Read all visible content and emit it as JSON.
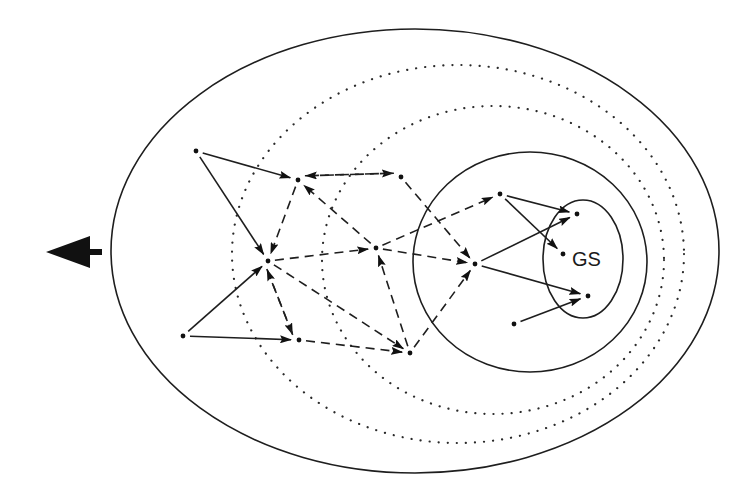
{
  "diagram": {
    "label_gs": "GS",
    "big_arrow": {
      "tip": [
        46,
        252
      ],
      "head_base_x": 90,
      "head_half_height": 16,
      "stem_end_x": 102,
      "stem_half_height": 3
    },
    "regions": [
      {
        "id": "outer",
        "style": "solid",
        "cx": 415,
        "cy": 251,
        "rx": 304,
        "ry": 222
      },
      {
        "id": "dotted-outer",
        "style": "dotted",
        "cx": 458,
        "cy": 254,
        "rx": 226,
        "ry": 189
      },
      {
        "id": "dotted-inner",
        "style": "dotted",
        "cx": 493,
        "cy": 260,
        "rx": 171,
        "ry": 154
      },
      {
        "id": "middle",
        "style": "solid",
        "cx": 530,
        "cy": 262,
        "rx": 117,
        "ry": 110
      },
      {
        "id": "goal-set",
        "style": "solid",
        "cx": 583,
        "cy": 259,
        "rx": 40,
        "ry": 59
      }
    ],
    "nodes": [
      {
        "id": "A",
        "x": 196,
        "y": 151
      },
      {
        "id": "B",
        "x": 298,
        "y": 180
      },
      {
        "id": "C",
        "x": 268,
        "y": 261
      },
      {
        "id": "D",
        "x": 401,
        "y": 177
      },
      {
        "id": "E",
        "x": 376,
        "y": 248
      },
      {
        "id": "F",
        "x": 183,
        "y": 336
      },
      {
        "id": "G",
        "x": 299,
        "y": 340
      },
      {
        "id": "H",
        "x": 410,
        "y": 353
      },
      {
        "id": "I",
        "x": 500,
        "y": 194
      },
      {
        "id": "J",
        "x": 475,
        "y": 264
      },
      {
        "id": "K",
        "x": 577,
        "y": 214
      },
      {
        "id": "L",
        "x": 563,
        "y": 254
      },
      {
        "id": "M",
        "x": 588,
        "y": 296
      },
      {
        "id": "N",
        "x": 514,
        "y": 324
      }
    ],
    "edges": [
      {
        "from": "A",
        "to": "B",
        "style": "solid"
      },
      {
        "from": "A",
        "to": "C",
        "style": "solid"
      },
      {
        "from": "F",
        "to": "C",
        "style": "solid"
      },
      {
        "from": "F",
        "to": "G",
        "style": "solid"
      },
      {
        "from": "B",
        "to": "D",
        "style": "dashed",
        "offset": -4
      },
      {
        "from": "D",
        "to": "B",
        "style": "dashed",
        "offset": -4
      },
      {
        "from": "B",
        "to": "C",
        "style": "dashed"
      },
      {
        "from": "E",
        "to": "B",
        "style": "dashed"
      },
      {
        "from": "C",
        "to": "E",
        "style": "dashed"
      },
      {
        "from": "C",
        "to": "G",
        "style": "dashed",
        "offset": 4
      },
      {
        "from": "G",
        "to": "C",
        "style": "dashed",
        "offset": 4
      },
      {
        "from": "C",
        "to": "H",
        "style": "dashed"
      },
      {
        "from": "G",
        "to": "H",
        "style": "dashed"
      },
      {
        "from": "H",
        "to": "E",
        "style": "dashed"
      },
      {
        "from": "D",
        "to": "J",
        "style": "dashed"
      },
      {
        "from": "E",
        "to": "J",
        "style": "dashed"
      },
      {
        "from": "E",
        "to": "I",
        "style": "dashed"
      },
      {
        "from": "H",
        "to": "J",
        "style": "dashed"
      },
      {
        "from": "I",
        "to": "K",
        "style": "solid"
      },
      {
        "from": "I",
        "to": "L",
        "style": "solid"
      },
      {
        "from": "J",
        "to": "K",
        "style": "solid"
      },
      {
        "from": "J",
        "to": "M",
        "style": "solid"
      },
      {
        "from": "N",
        "to": "M",
        "style": "solid"
      }
    ]
  }
}
